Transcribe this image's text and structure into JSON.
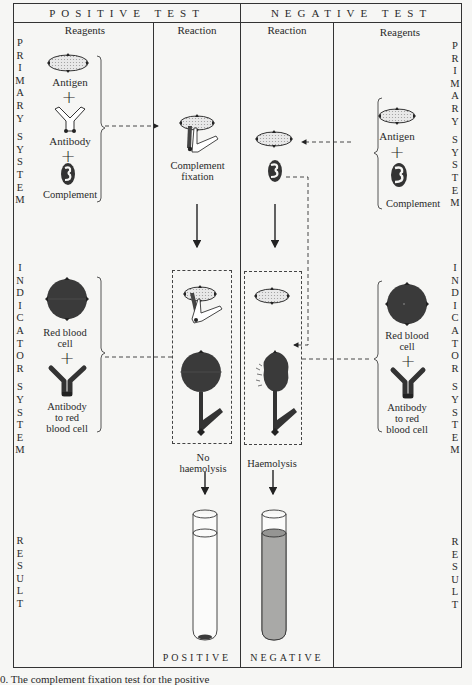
{
  "header": {
    "positive_test": "POSITIVE TEST",
    "negative_test": "NEGATIVE TEST"
  },
  "columns": {
    "left_reagents": "Reagents",
    "positive_reaction": "Reaction",
    "negative_reaction": "Reaction",
    "right_reagents": "Reagents"
  },
  "side_labels": {
    "primary": "PRIMARY SYSTEM",
    "indicator": "INDICATOR SYSTEM",
    "result": "RESULT"
  },
  "primary_system": {
    "antigen": "Antigen",
    "antibody": "Antibody",
    "complement": "Complement",
    "complement_fixation_line1": "Complement",
    "complement_fixation_line2": "fixation"
  },
  "indicator_system": {
    "rbc_line1": "Red blood",
    "rbc_line2": "cell",
    "anti_rbc_line1": "Antibody",
    "anti_rbc_line2": "to red",
    "anti_rbc_line3": "blood cell",
    "no_haemolysis_line1": "No",
    "no_haemolysis_line2": "haemolysis",
    "haemolysis": "Haemolysis"
  },
  "results": {
    "positive": "POSITIVE",
    "negative": "NEGATIVE"
  },
  "plus_sign": "+",
  "caption": "0. The complement fixation test for the positive"
}
